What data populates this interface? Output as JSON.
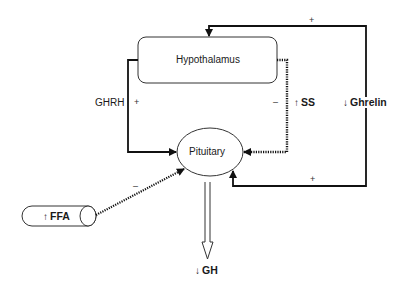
{
  "nodes": {
    "hypothalamus": {
      "label": "Hypothalamus"
    },
    "pituitary": {
      "label": "Pituitary"
    },
    "ffa": {
      "arrow": "↑",
      "label": "FFA"
    }
  },
  "edges": {
    "ghrh": {
      "label": "GHRH",
      "sign": "+"
    },
    "somatostatin": {
      "sign": "–",
      "arrow": "↑",
      "label": "SS"
    },
    "ghrelin": {
      "arrow": "↓",
      "label": "Ghrelin",
      "sign_top": "+",
      "sign_bottom": "+"
    },
    "ffa_to_pituitary": {
      "sign": "–"
    },
    "gh_output": {
      "arrow": "↓",
      "label": "GH"
    }
  },
  "colors": {
    "line": "#111111",
    "box_border": "#333333",
    "background": "#ffffff"
  }
}
